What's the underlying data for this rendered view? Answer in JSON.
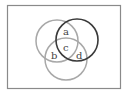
{
  "diagram": {
    "type": "venn",
    "frame": {
      "x": 7,
      "y": 5,
      "width": 114,
      "height": 84,
      "stroke": "#8a8a8a"
    },
    "circles": [
      {
        "name": "left-circle",
        "cx": 57,
        "cy": 41,
        "r": 21,
        "stroke": "#a8a8a8"
      },
      {
        "name": "bottom-circle",
        "cx": 66,
        "cy": 59,
        "r": 21,
        "stroke": "#a8a8a8"
      },
      {
        "name": "right-circle",
        "cx": 77,
        "cy": 40,
        "r": 21,
        "stroke": "#3a3a3a"
      }
    ],
    "labels": [
      {
        "text": "a",
        "x": 66,
        "y": 34
      },
      {
        "text": "b",
        "x": 54,
        "y": 58
      },
      {
        "text": "c",
        "x": 66,
        "y": 50
      },
      {
        "text": "d",
        "x": 79,
        "y": 58
      }
    ]
  }
}
